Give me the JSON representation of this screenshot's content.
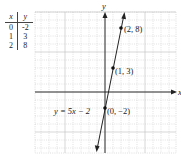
{
  "table": {
    "headers": [
      "x",
      "y"
    ],
    "rows": [
      [
        "0",
        "-2"
      ],
      [
        "1",
        "3"
      ],
      [
        "2",
        "8"
      ]
    ]
  },
  "chart_data": {
    "type": "line",
    "title": "",
    "equation_label": "y = 5x − 2",
    "xlabel": "x",
    "ylabel": "y",
    "points": [
      {
        "x": 0,
        "y": -2,
        "label": "(0, −2)"
      },
      {
        "x": 1,
        "y": 3,
        "label": "(1, 3)"
      },
      {
        "x": 2,
        "y": 8,
        "label": "(2, 8)"
      }
    ],
    "series": [
      {
        "name": "y = 5x − 2",
        "slope": 5,
        "intercept": -2
      }
    ],
    "xlim": [
      -8.75,
      8.875
    ],
    "ylim": [
      -7.625,
      10
    ],
    "grid": true,
    "axis_arrows": true
  }
}
